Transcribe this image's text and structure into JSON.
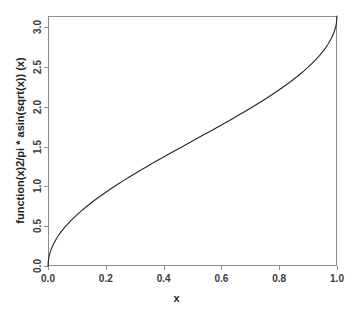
{
  "chart_data": {
    "type": "line",
    "title": "",
    "xlabel": "x",
    "ylabel": "function(x)2/pi * asin(sqrt(x)) (x)",
    "xlim": [
      0.0,
      1.0
    ],
    "ylim": [
      0.0,
      3.141592653589793
    ],
    "grid": false,
    "legend": null,
    "xticks": [
      0.0,
      0.2,
      0.4,
      0.6,
      0.8,
      1.0
    ],
    "xtick_labels": [
      "0.0",
      "0.2",
      "0.4",
      "0.6",
      "0.8",
      "1.0"
    ],
    "yticks": [
      0.0,
      0.5,
      1.0,
      1.5,
      2.0,
      2.5,
      3.0
    ],
    "ytick_labels": [
      "0.0",
      "0.5",
      "1.0",
      "1.5",
      "2.0",
      "2.5",
      "3.0"
    ],
    "series": [
      {
        "name": "2 * asin(sqrt(x))",
        "color": "#262626",
        "linewidth": 1.1,
        "x": [
          0.0,
          0.002,
          0.005,
          0.01,
          0.015,
          0.02,
          0.03,
          0.04,
          0.05,
          0.06,
          0.08,
          0.1,
          0.12,
          0.14,
          0.16,
          0.18,
          0.2,
          0.22,
          0.24,
          0.26,
          0.28,
          0.3,
          0.32,
          0.34,
          0.36,
          0.38,
          0.4,
          0.42,
          0.44,
          0.46,
          0.48,
          0.5,
          0.52,
          0.54,
          0.56,
          0.58,
          0.6,
          0.62,
          0.64,
          0.66,
          0.68,
          0.7,
          0.72,
          0.74,
          0.76,
          0.78,
          0.8,
          0.82,
          0.84,
          0.86,
          0.88,
          0.9,
          0.92,
          0.94,
          0.95,
          0.96,
          0.97,
          0.98,
          0.985,
          0.99,
          0.995,
          0.998,
          1.0
        ],
        "y": [
          0.0,
          0.0895,
          0.1416,
          0.2003,
          0.2455,
          0.2838,
          0.3482,
          0.4027,
          0.451,
          0.4949,
          0.5735,
          0.6435,
          0.7075,
          0.767,
          0.823,
          0.8761,
          0.9273,
          0.9764,
          1.0239,
          1.0701,
          1.1152,
          1.1593,
          1.2025,
          1.2451,
          1.287,
          1.3284,
          1.3694,
          1.41,
          1.4503,
          1.4904,
          1.5303,
          1.5708,
          1.6113,
          1.6512,
          1.6913,
          1.7316,
          1.7722,
          1.8132,
          1.8546,
          1.8965,
          1.9391,
          1.9823,
          2.0264,
          2.0715,
          2.1177,
          2.1652,
          2.2143,
          2.2655,
          2.3186,
          2.3746,
          2.4341,
          2.4981,
          2.5681,
          2.6467,
          2.6906,
          2.7389,
          2.7934,
          2.8578,
          2.8965,
          2.9413,
          3.0,
          3.0522,
          3.14159
        ]
      }
    ],
    "axis_color": "#8c8c8c",
    "tick_color": "#8c8c8c",
    "background": "#ffffff",
    "plot_box": {
      "left": 48,
      "top": 16,
      "right": 337,
      "bottom": 266
    }
  }
}
